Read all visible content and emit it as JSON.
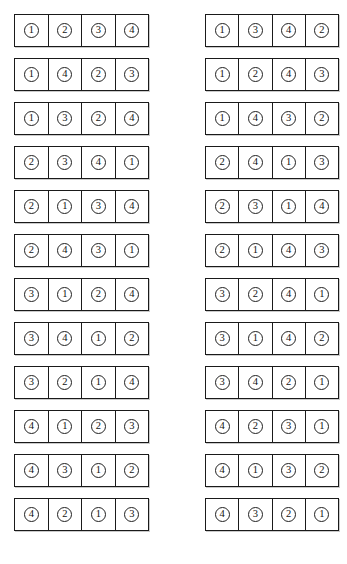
{
  "figure": {
    "token_symbols": [
      "1",
      "2",
      "3",
      "4"
    ],
    "layout": {
      "columns": 2,
      "rows_per_column": 12,
      "cells_per_strip": 4,
      "total_strips": 24
    },
    "colors": {
      "background": "#ffffff",
      "stroke": "#1a1a1a",
      "text": "#121212"
    }
  },
  "columns": [
    {
      "name": "left-column",
      "strips": [
        {
          "name": "permutation-1",
          "cells": [
            "1",
            "2",
            "3",
            "4"
          ]
        },
        {
          "name": "permutation-2",
          "cells": [
            "1",
            "4",
            "2",
            "3"
          ]
        },
        {
          "name": "permutation-3",
          "cells": [
            "1",
            "3",
            "2",
            "4"
          ]
        },
        {
          "name": "permutation-4",
          "cells": [
            "2",
            "3",
            "4",
            "1"
          ]
        },
        {
          "name": "permutation-5",
          "cells": [
            "2",
            "1",
            "3",
            "4"
          ]
        },
        {
          "name": "permutation-6",
          "cells": [
            "2",
            "4",
            "3",
            "1"
          ]
        },
        {
          "name": "permutation-7",
          "cells": [
            "3",
            "1",
            "2",
            "4"
          ]
        },
        {
          "name": "permutation-8",
          "cells": [
            "3",
            "4",
            "1",
            "2"
          ]
        },
        {
          "name": "permutation-9",
          "cells": [
            "3",
            "2",
            "1",
            "4"
          ]
        },
        {
          "name": "permutation-10",
          "cells": [
            "4",
            "1",
            "2",
            "3"
          ]
        },
        {
          "name": "permutation-11",
          "cells": [
            "4",
            "3",
            "1",
            "2"
          ]
        },
        {
          "name": "permutation-12",
          "cells": [
            "4",
            "2",
            "1",
            "3"
          ]
        }
      ]
    },
    {
      "name": "right-column",
      "strips": [
        {
          "name": "permutation-13",
          "cells": [
            "1",
            "3",
            "4",
            "2"
          ]
        },
        {
          "name": "permutation-14",
          "cells": [
            "1",
            "2",
            "4",
            "3"
          ]
        },
        {
          "name": "permutation-15",
          "cells": [
            "1",
            "4",
            "3",
            "2"
          ]
        },
        {
          "name": "permutation-16",
          "cells": [
            "2",
            "4",
            "1",
            "3"
          ]
        },
        {
          "name": "permutation-17",
          "cells": [
            "2",
            "3",
            "1",
            "4"
          ]
        },
        {
          "name": "permutation-18",
          "cells": [
            "2",
            "1",
            "4",
            "3"
          ]
        },
        {
          "name": "permutation-19",
          "cells": [
            "3",
            "2",
            "4",
            "1"
          ]
        },
        {
          "name": "permutation-20",
          "cells": [
            "3",
            "1",
            "4",
            "2"
          ]
        },
        {
          "name": "permutation-21",
          "cells": [
            "3",
            "4",
            "2",
            "1"
          ]
        },
        {
          "name": "permutation-22",
          "cells": [
            "4",
            "2",
            "3",
            "1"
          ]
        },
        {
          "name": "permutation-23",
          "cells": [
            "4",
            "1",
            "3",
            "2"
          ]
        },
        {
          "name": "permutation-24",
          "cells": [
            "4",
            "3",
            "2",
            "1"
          ]
        }
      ]
    }
  ]
}
